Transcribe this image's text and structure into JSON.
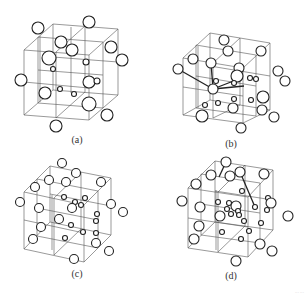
{
  "figure": {
    "panels": [
      {
        "id": "a",
        "label": "(a)"
      },
      {
        "id": "b",
        "label": "(b)"
      },
      {
        "id": "c",
        "label": "(c)"
      },
      {
        "id": "d",
        "label": "(d)"
      }
    ],
    "footer_text": "···  ···"
  }
}
